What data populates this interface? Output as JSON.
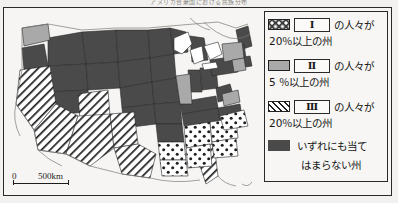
{
  "figure": {
    "title": "アメリカ合衆国における民族分布",
    "background_color": "#f2f1ef",
    "frame_color": "#2a2a2a"
  },
  "map": {
    "name": "united-states-map",
    "scalebar": {
      "zero_label": "0",
      "max_label": "500km"
    },
    "fills": {
      "dotted": "#3b3b3b",
      "gray": "#a9a9a9",
      "hatch": "#1f1f1f",
      "dark": "#4a4a4a",
      "water": "#ffffff",
      "outline": "#2a2a2a"
    },
    "regions": {
      "dotted_states": [
        "Mississippi",
        "Alabama",
        "Georgia",
        "South Carolina",
        "Louisiana"
      ],
      "gray_states": [
        "Washington",
        "Illinois",
        "New York",
        "New Jersey",
        "Maryland",
        "Virginia"
      ],
      "hatched_states": [
        "California",
        "Nevada",
        "Arizona",
        "New Mexico",
        "Texas",
        "Colorado",
        "Florida"
      ],
      "dark_states": [
        "Oregon",
        "Idaho",
        "Montana",
        "Wyoming",
        "Utah",
        "North Dakota",
        "South Dakota",
        "Nebraska",
        "Kansas",
        "Oklahoma",
        "Minnesota",
        "Iowa",
        "Missouri",
        "Arkansas",
        "Wisconsin",
        "Michigan",
        "Indiana",
        "Ohio",
        "Kentucky",
        "Tennessee",
        "North Carolina",
        "West Virginia",
        "Pennsylvania",
        "Maine",
        "New Hampshire",
        "Vermont",
        "Massachusetts",
        "Connecticut",
        "Rhode Island",
        "Delaware"
      ]
    }
  },
  "legend": {
    "entries": [
      {
        "swatch": "dotted-swatch",
        "numeral": "Ⅰ",
        "tail": "の人々が",
        "line2": "20％以上の州"
      },
      {
        "swatch": "gray-swatch",
        "numeral": "Ⅱ",
        "tail": "の人々が",
        "line2": "5 ％以上の州"
      },
      {
        "swatch": "hatch-swatch",
        "numeral": "Ⅲ",
        "tail": "の人々が",
        "line2": "20％以上の州"
      },
      {
        "swatch": "dark-swatch",
        "numeral": "",
        "tail": "いずれにも当て",
        "line2": "はまらない州"
      }
    ]
  }
}
